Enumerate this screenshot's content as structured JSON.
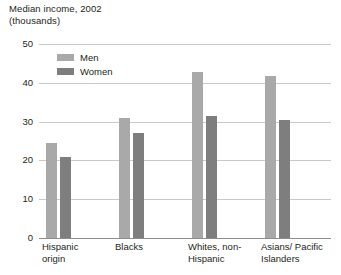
{
  "chart_data": {
    "type": "bar",
    "title": "Median income, 2002\n(thousands)",
    "xlabel": "",
    "ylabel": "",
    "ylim": [
      0,
      50
    ],
    "yticks": [
      50,
      40,
      30,
      20,
      10,
      0
    ],
    "grid": true,
    "legend_position": "top-left-inside",
    "categories": [
      "Hispanic\norigin",
      "Blacks",
      "Whites, non-\nHispanic",
      "Asians/ Pacific\nIslanders"
    ],
    "series": [
      {
        "name": "Men",
        "color": "#a9a9a9",
        "values": [
          24.5,
          31.0,
          42.7,
          41.7
        ]
      },
      {
        "name": "Women",
        "color": "#7e7e7e",
        "values": [
          21.0,
          27.0,
          31.4,
          30.4
        ]
      }
    ]
  },
  "colors": {
    "men": "#a9a9a9",
    "women": "#7e7e7e",
    "gridline": "#c9c9c9",
    "axis": "#8d8d8d",
    "text": "#231f20"
  }
}
